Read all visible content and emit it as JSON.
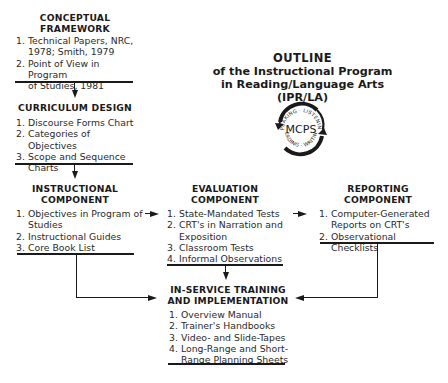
{
  "title": {
    "line1": "OUTLINE",
    "line2": "of the Instructional Program",
    "line3": "in Reading/Language Arts (IPR/LA)"
  },
  "logo": {
    "center_text": "MCPS",
    "top_arc_text": "SPEAKING · LISTENING",
    "bottom_arc_text": "READING · WRITING",
    "icon": "circular-arrows-logo"
  },
  "boxes": {
    "conceptual_framework": {
      "header_line1": "CONCEPTUAL",
      "header_line2": "FRAMEWORK",
      "items": [
        {
          "num": "1.",
          "line1": "Technical Papers, NRC,",
          "line2": "1978; Smith, 1979"
        },
        {
          "num": "2.",
          "line1": "Point of View in Program",
          "line2": "of Studies, 1981"
        }
      ]
    },
    "curriculum_design": {
      "header_line1": "CURRICULUM DESIGN",
      "items": [
        {
          "num": "1.",
          "line1": "Discourse Forms Chart"
        },
        {
          "num": "2.",
          "line1": "Categories of Objectives"
        },
        {
          "num": "3.",
          "line1": "Scope and Sequence",
          "line2": "Charts"
        }
      ]
    },
    "instructional_component": {
      "header_line1": "INSTRUCTIONAL",
      "header_line2": "COMPONENT",
      "items": [
        {
          "num": "1.",
          "line1": "Objectives in Program of",
          "line2": "Studies"
        },
        {
          "num": "2.",
          "line1": "Instructional Guides"
        },
        {
          "num": "3.",
          "line1": "Core Book List"
        }
      ]
    },
    "evaluation_component": {
      "header_line1": "EVALUATION",
      "header_line2": "COMPONENT",
      "items": [
        {
          "num": "1.",
          "line1": "State-Mandated Tests"
        },
        {
          "num": "2.",
          "line1": "CRT's in Narration and",
          "line2": "Exposition"
        },
        {
          "num": "3.",
          "line1": "Classroom Tests"
        },
        {
          "num": "4.",
          "line1": "Informal Observations"
        }
      ]
    },
    "reporting_component": {
      "header_line1": "REPORTING",
      "header_line2": "COMPONENT",
      "items": [
        {
          "num": "1.",
          "line1": "Computer-Generated",
          "line2": "Reports on CRT's"
        },
        {
          "num": "2.",
          "line1": "Observational Checklists"
        }
      ]
    },
    "inservice_training": {
      "header_line1": "IN-SERVICE TRAINING",
      "header_line2": "AND IMPLEMENTATION",
      "items": [
        {
          "num": "1.",
          "line1": "Overview Manual"
        },
        {
          "num": "2.",
          "line1": "Trainer's Handbooks"
        },
        {
          "num": "3.",
          "line1": "Video- and Slide-Tapes"
        },
        {
          "num": "4.",
          "line1": "Long-Range and Short-",
          "line2": "Range Planning Sheets"
        }
      ]
    }
  },
  "connections": [
    {
      "from": "conceptual_framework",
      "to": "curriculum_design"
    },
    {
      "from": "curriculum_design",
      "to": "instructional_component"
    },
    {
      "from": "instructional_component",
      "to": "evaluation_component"
    },
    {
      "from": "evaluation_component",
      "to": "reporting_component"
    },
    {
      "from": "instructional_component",
      "to": "inservice_training"
    },
    {
      "from": "evaluation_component",
      "to": "inservice_training"
    },
    {
      "from": "reporting_component",
      "to": "inservice_training"
    }
  ],
  "colors": {
    "ink": "#1a1a1a",
    "background": "#ffffff"
  }
}
